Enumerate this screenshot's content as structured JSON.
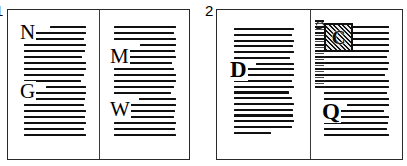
{
  "figure": {
    "background_color": "#ffffff",
    "ink_color": "#101010",
    "frame_color": "#2a2a2a"
  },
  "panels": [
    {
      "number": "1",
      "label_name": "panel-number-1",
      "pages": [
        {
          "side": "verso",
          "initials": [
            {
              "glyph": "N",
              "position": "top-left",
              "style": "plain-capital"
            },
            {
              "glyph": "G",
              "position": "mid-left",
              "style": "plain-capital"
            }
          ],
          "text_lines": 19,
          "notes": "Full text block, two plain drop-cap initials, no ornament"
        },
        {
          "side": "recto",
          "initials": [
            {
              "glyph": "M",
              "position": "upper-left",
              "style": "plain-capital"
            },
            {
              "glyph": "W",
              "position": "lower-left",
              "style": "plain-capital"
            }
          ],
          "text_lines": 19,
          "notes": "Full text block, two plain drop-cap initials, no ornament"
        }
      ]
    },
    {
      "number": "2",
      "label_name": "panel-number-2",
      "pages": [
        {
          "side": "verso",
          "initials": [
            {
              "glyph": "D",
              "position": "upper-mid-left",
              "style": "plain-capital"
            }
          ],
          "text_lines": 19,
          "notes": "Single plain drop-cap initial, short last line"
        },
        {
          "side": "recto",
          "initials": [
            {
              "glyph": "C",
              "position": "top-left",
              "style": "historiated-boxed-initial"
            },
            {
              "glyph": "Q",
              "position": "lower-left",
              "style": "plain-capital"
            }
          ],
          "ornament": {
            "type": "marginal-vine-flourish",
            "position": "left-margin-top",
            "attached_to": "historiated-initial"
          },
          "text_lines": 19,
          "notes": "Decorated boxed initial with marginal vine, plus plain Q initial"
        }
      ]
    }
  ]
}
